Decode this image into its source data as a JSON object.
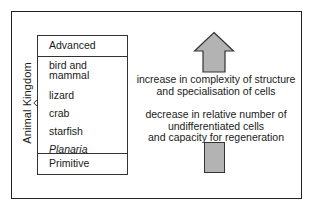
{
  "diagram": {
    "side_label": "Animal Kingdom",
    "table": {
      "header": "Advanced",
      "items": [
        {
          "label": "bird and\nmammal",
          "line1": "bird and",
          "line2": "mammal",
          "italic": false
        },
        {
          "label": "lizard",
          "italic": false
        },
        {
          "label": "crab",
          "italic": false
        },
        {
          "label": "starfish",
          "italic": false
        },
        {
          "label": "Planaria",
          "italic": true
        }
      ],
      "footer": "Primitive"
    },
    "arrow": {
      "direction": "up",
      "fill_color": "#b3b3b3",
      "outline_color": "#333333"
    },
    "statements": [
      {
        "line1": "increase in complexity of structure",
        "line2": "and specialisation of cells"
      },
      {
        "line1": "decrease in relative number of",
        "line2": "undifferentiated cells",
        "line3": "and capacity for regeneration"
      }
    ]
  }
}
